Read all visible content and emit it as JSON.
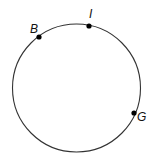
{
  "diagram": {
    "type": "circle-with-points",
    "circle": {
      "cx": 76.5,
      "cy": 88,
      "r": 64,
      "stroke": "#333333"
    },
    "points": [
      {
        "label": "B",
        "x": 39,
        "y": 37,
        "label_x": 30,
        "label_y": 33
      },
      {
        "label": "I",
        "x": 89,
        "y": 26,
        "label_x": 89,
        "label_y": 18
      },
      {
        "label": "G",
        "x": 134,
        "y": 113,
        "label_x": 137,
        "label_y": 121
      }
    ]
  }
}
